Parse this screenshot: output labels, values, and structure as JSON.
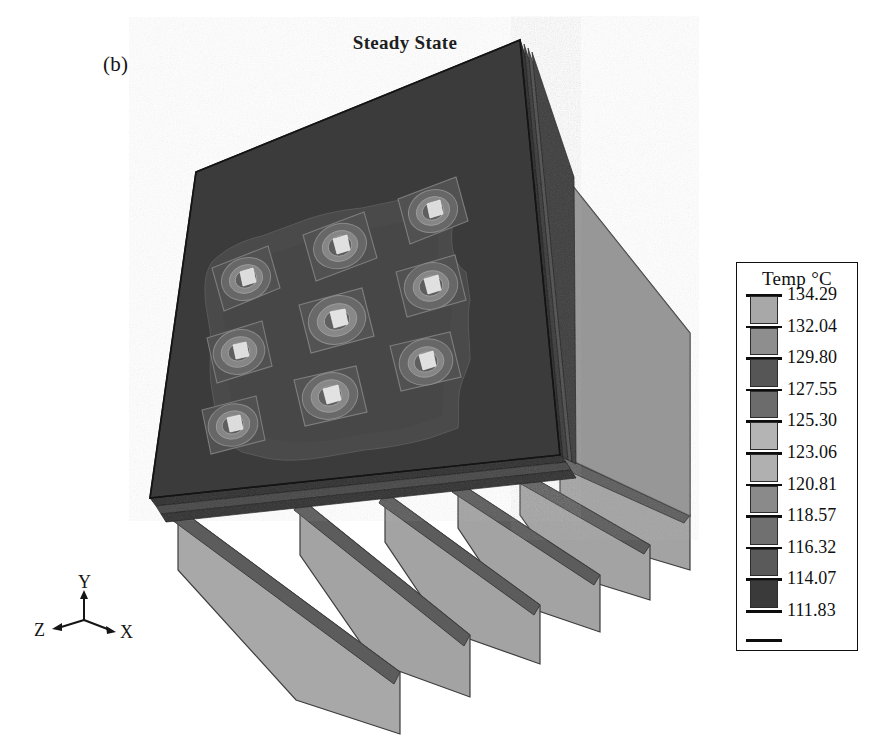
{
  "figure": {
    "panel_label": "(b)",
    "title": "Steady State"
  },
  "axis_triad": {
    "x_label": "X",
    "y_label": "Y",
    "z_label": "Z"
  },
  "legend": {
    "title": "Temp °C",
    "values": [
      "134.29",
      "132.04",
      "129.80",
      "127.55",
      "125.30",
      "123.06",
      "120.81",
      "118.57",
      "116.32",
      "114.07",
      "111.83"
    ],
    "swatch_colors": [
      "#a8a8a8",
      "#8e8e8e",
      "#565656",
      "#6c6c6c",
      "#b4b4b4",
      "#b0b0b0",
      "#8a8a8a",
      "#707070",
      "#5a5a5a",
      "#3a3a3a"
    ]
  },
  "chart_data": {
    "type": "heatmap",
    "title": "Steady State",
    "subtitle": "(b)",
    "colorbar_label": "Temp °C",
    "colorbar_ticks": [
      134.29,
      132.04,
      129.8,
      127.55,
      125.3,
      123.06,
      120.81,
      118.57,
      116.32,
      114.07,
      111.83
    ],
    "vmin": 111.83,
    "vmax": 134.29,
    "units": "°C",
    "n_bands": 10,
    "band_step": 2.246,
    "colormap": "grayscale",
    "geometry": "finned heat sink plate with 3x3 array of heat sources",
    "n_fins": 6,
    "heat_sources": {
      "rows": 3,
      "cols": 3,
      "count": 9,
      "peak_temp": 134.29,
      "base_temp": 111.83
    },
    "xlabel": "X",
    "ylabel": "Y",
    "zlabel": "Z",
    "grid": false,
    "legend_position": "right"
  },
  "colors": {
    "front_face": "#3b3b3b",
    "side_face": "#9a9a9a",
    "fin_face": "#a3a3a3",
    "fin_edge": "#595959",
    "chip_band_outer": "#555555",
    "chip_band_mid": "#7c7c7c",
    "chip_band_inner": "#9e9e9e",
    "chip_core": "#d8d8d8",
    "contour_region": "#4a4a4a",
    "outline": "#1a1a1a",
    "background": "#ffffff"
  }
}
